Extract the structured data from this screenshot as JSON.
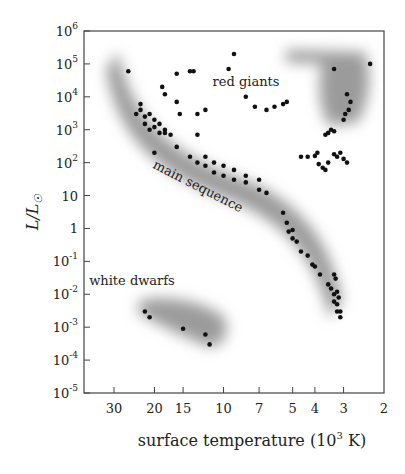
{
  "chart_data": {
    "type": "scatter",
    "title": "",
    "xlabel": "surface temperature  (10^3 K)",
    "xlabel_parts": {
      "main": "surface temperature  (10",
      "sup": "3",
      "tail": " K)"
    },
    "ylabel": "L/L☉",
    "x_scale": "log (reversed)",
    "y_scale": "log",
    "xlim": [
      40,
      2
    ],
    "ylim": [
      1e-05,
      1000000.0
    ],
    "grid": false,
    "legend": null,
    "x_ticks": [
      {
        "label": "30",
        "value": 30
      },
      {
        "label": "20",
        "value": 20
      },
      {
        "label": "15",
        "value": 15
      },
      {
        "label": "10",
        "value": 10
      },
      {
        "label": "7",
        "value": 7
      },
      {
        "label": "5",
        "value": 5
      },
      {
        "label": "4",
        "value": 4
      },
      {
        "label": "3",
        "value": 3
      },
      {
        "label": "2",
        "value": 2
      }
    ],
    "y_ticks": [
      {
        "base": "10",
        "exp": "6",
        "value": 1000000.0
      },
      {
        "base": "10",
        "exp": "5",
        "value": 100000.0
      },
      {
        "base": "10",
        "exp": "4",
        "value": 10000.0
      },
      {
        "base": "10",
        "exp": "3",
        "value": 1000.0
      },
      {
        "base": "10",
        "exp": "2",
        "value": 100.0
      },
      {
        "base": "10",
        "exp": "",
        "value": 10
      },
      {
        "base": "1",
        "exp": "",
        "value": 1
      },
      {
        "base": "10",
        "exp": "-1",
        "value": 0.1
      },
      {
        "base": "10",
        "exp": "-2",
        "value": 0.01
      },
      {
        "base": "10",
        "exp": "-3",
        "value": 0.001
      },
      {
        "base": "10",
        "exp": "-4",
        "value": 0.0001
      },
      {
        "base": "10",
        "exp": "-5",
        "value": 1e-05
      }
    ],
    "annotations": [
      {
        "text": "red giants",
        "x_px": 246,
        "y_px": 86,
        "rotate": 0
      },
      {
        "text": "main sequence",
        "x_px": 196,
        "y_px": 190,
        "rotate": 27
      },
      {
        "text": "white dwarfs",
        "x_px": 132,
        "y_px": 285,
        "rotate": 0
      }
    ],
    "regions": [
      {
        "name": "main sequence",
        "path": "M118,52 C132,120 170,152 240,178 C300,200 330,240 342,300 L330,318 C315,260 290,225 230,200 C160,175 118,140 106,70 Z"
      },
      {
        "name": "red giants",
        "path": "M286,50 L365,52 C372,75 370,100 358,122 L330,126 C318,110 318,80 322,64 L286,62 Z"
      },
      {
        "name": "white dwarfs",
        "path": "M140,300 C165,295 200,300 222,315 C232,330 225,345 210,347 C190,340 160,325 138,313 Z"
      }
    ],
    "points_description": "Individual stars plotted as black dots; approximate (T in 10^3 K, L/L☉)",
    "series": [
      {
        "name": "main sequence",
        "points": [
          [
            26,
            60000
          ],
          [
            24,
            3000
          ],
          [
            23,
            6000
          ],
          [
            23,
            4000
          ],
          [
            22,
            2500
          ],
          [
            22,
            1500
          ],
          [
            21,
            3000
          ],
          [
            21,
            1000
          ],
          [
            20,
            2000
          ],
          [
            20,
            1200
          ],
          [
            19,
            800
          ],
          [
            19,
            1500
          ],
          [
            18,
            1000
          ],
          [
            18,
            800
          ],
          [
            20,
            200
          ],
          [
            17,
            700
          ],
          [
            16,
            300
          ],
          [
            14,
            150
          ],
          [
            13,
            100
          ],
          [
            12,
            150
          ],
          [
            12,
            80
          ],
          [
            11,
            100
          ],
          [
            11,
            50
          ],
          [
            10,
            80
          ],
          [
            10,
            40
          ],
          [
            9,
            60
          ],
          [
            9,
            30
          ],
          [
            8,
            40
          ],
          [
            8,
            25
          ],
          [
            7,
            30
          ],
          [
            7,
            15
          ],
          [
            6.5,
            12
          ],
          [
            5.5,
            3
          ],
          [
            5.3,
            1.5
          ],
          [
            5.2,
            0.8
          ],
          [
            5,
            0.9
          ],
          [
            5,
            0.5
          ],
          [
            4.8,
            0.4
          ],
          [
            4.6,
            0.2
          ],
          [
            4.3,
            0.15
          ],
          [
            4.1,
            0.08
          ],
          [
            4,
            0.07
          ],
          [
            3.8,
            0.04
          ],
          [
            3.5,
            0.02
          ],
          [
            3.4,
            0.015
          ],
          [
            3.3,
            0.01
          ],
          [
            3.3,
            0.006
          ],
          [
            3.2,
            0.005
          ],
          [
            3.2,
            0.003
          ],
          [
            3.1,
            0.003
          ],
          [
            3.1,
            0.002
          ],
          [
            3.15,
            0.008
          ],
          [
            3.2,
            0.012
          ],
          [
            3.25,
            0.03
          ],
          [
            3.3,
            0.04
          ]
        ]
      },
      {
        "name": "red giants",
        "points": [
          [
            9,
            200000
          ],
          [
            9.5,
            70000
          ],
          [
            14,
            60000
          ],
          [
            13.5,
            60000
          ],
          [
            16,
            50000
          ],
          [
            18,
            12000
          ],
          [
            18.5,
            20000
          ],
          [
            16,
            7000
          ],
          [
            15.5,
            3000
          ],
          [
            13,
            3000
          ],
          [
            12,
            4000
          ],
          [
            13,
            700
          ],
          [
            8,
            10000
          ],
          [
            7.3,
            5000
          ],
          [
            6.5,
            4000
          ],
          [
            6,
            5000
          ],
          [
            5.5,
            6000
          ],
          [
            5.3,
            7000
          ],
          [
            3.3,
            70000
          ],
          [
            2.9,
            12000
          ],
          [
            2.8,
            7000
          ],
          [
            2.85,
            4000
          ],
          [
            2.95,
            3000
          ],
          [
            3,
            2000
          ],
          [
            3.3,
            900
          ],
          [
            3.4,
            1000
          ],
          [
            3.5,
            800
          ],
          [
            3.6,
            700
          ],
          [
            4.6,
            150
          ],
          [
            4.3,
            150
          ],
          [
            4,
            160
          ],
          [
            3.9,
            200
          ],
          [
            3.85,
            90
          ],
          [
            3.7,
            70
          ],
          [
            3.6,
            60
          ],
          [
            3.5,
            100
          ],
          [
            3.3,
            180
          ],
          [
            3.2,
            150
          ],
          [
            3.1,
            200
          ],
          [
            3.0,
            130
          ],
          [
            2.9,
            100
          ],
          [
            2.3,
            100000
          ]
        ]
      },
      {
        "name": "white dwarfs",
        "points": [
          [
            22,
            0.003
          ],
          [
            21,
            0.002
          ],
          [
            15,
            0.0009
          ],
          [
            12,
            0.0006
          ],
          [
            11.5,
            0.0003
          ]
        ]
      }
    ]
  },
  "plot": {
    "left": 84,
    "right": 384,
    "top": 31,
    "bottom": 393
  }
}
